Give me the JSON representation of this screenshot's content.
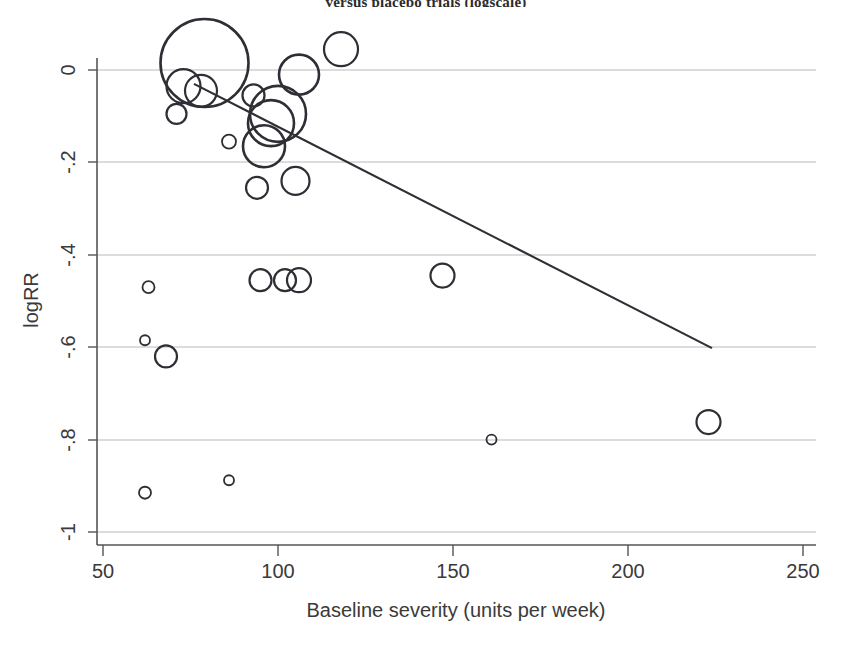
{
  "chart_data": {
    "type": "scatter",
    "title": "versus placebo trials (logscale)",
    "xlabel": "Baseline severity (units per week)",
    "ylabel": "logRR",
    "xlim": [
      35,
      265
    ],
    "ylim": [
      -1.06,
      0.1
    ],
    "xticks": [
      50,
      100,
      150,
      200,
      250
    ],
    "xtick_labels": [
      "50",
      "100",
      "150",
      "200",
      "250"
    ],
    "yticks": [
      0,
      -0.2,
      -0.4,
      -0.6,
      -0.8,
      -1
    ],
    "ytick_labels": [
      "0",
      "-.2",
      "-.4",
      "-.6",
      "-.8",
      "-1"
    ],
    "grid": "horizontal",
    "legend": "none",
    "marker": "open-circle",
    "point_color": "#2e2e35",
    "grid_color": "#b9b9b9",
    "axis_color": "#555555",
    "points": [
      {
        "x": 79,
        "y": 0.015,
        "size": 44
      },
      {
        "x": 118,
        "y": 0.045,
        "size": 17
      },
      {
        "x": 106,
        "y": -0.01,
        "size": 20
      },
      {
        "x": 73,
        "y": -0.035,
        "size": 17
      },
      {
        "x": 78,
        "y": -0.045,
        "size": 16
      },
      {
        "x": 93,
        "y": -0.055,
        "size": 11
      },
      {
        "x": 71,
        "y": -0.095,
        "size": 10
      },
      {
        "x": 100,
        "y": -0.095,
        "size": 28
      },
      {
        "x": 98,
        "y": -0.115,
        "size": 23
      },
      {
        "x": 86,
        "y": -0.155,
        "size": 7
      },
      {
        "x": 96,
        "y": -0.165,
        "size": 21
      },
      {
        "x": 94,
        "y": -0.255,
        "size": 11
      },
      {
        "x": 105,
        "y": -0.24,
        "size": 14
      },
      {
        "x": 63,
        "y": -0.47,
        "size": 6
      },
      {
        "x": 95,
        "y": -0.455,
        "size": 11
      },
      {
        "x": 102,
        "y": -0.455,
        "size": 11
      },
      {
        "x": 106,
        "y": -0.455,
        "size": 12
      },
      {
        "x": 147,
        "y": -0.445,
        "size": 12
      },
      {
        "x": 62,
        "y": -0.585,
        "size": 5
      },
      {
        "x": 68,
        "y": -0.62,
        "size": 11
      },
      {
        "x": 161,
        "y": -0.8,
        "size": 5
      },
      {
        "x": 223,
        "y": -0.762,
        "size": 12
      },
      {
        "x": 62,
        "y": -0.915,
        "size": 6
      },
      {
        "x": 86,
        "y": -0.888,
        "size": 5
      }
    ],
    "fit_line": {
      "x0": 76,
      "y0": -0.03,
      "x1": 224,
      "y1": -0.602,
      "color": "#2e2e35"
    }
  }
}
